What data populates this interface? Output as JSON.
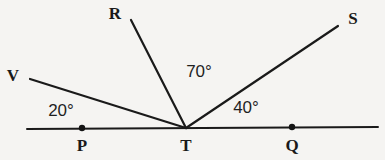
{
  "figure": {
    "type": "geometry-diagram",
    "background_color": "#f5f4f2",
    "stroke_color": "#1a1a1a",
    "width": 385,
    "height": 160
  },
  "points": [
    {
      "name": "P",
      "label": "P",
      "x": 82,
      "y": 128,
      "label_x": 82,
      "label_y": 145,
      "dot": true
    },
    {
      "name": "T",
      "label": "T",
      "x": 186,
      "y": 128,
      "label_x": 186,
      "label_y": 145,
      "dot": false
    },
    {
      "name": "Q",
      "label": "Q",
      "x": 292,
      "y": 127,
      "label_x": 292,
      "label_y": 145,
      "dot": true
    },
    {
      "name": "V",
      "label": "V",
      "x": 30,
      "y": 79,
      "label_x": 13,
      "label_y": 75,
      "dot": false
    },
    {
      "name": "R",
      "label": "R",
      "x": 131,
      "y": 20,
      "label_x": 115,
      "label_y": 13,
      "dot": false
    },
    {
      "name": "S",
      "label": "S",
      "x": 338,
      "y": 26,
      "label_x": 353,
      "label_y": 18,
      "dot": false
    }
  ],
  "base_line": {
    "name": "line-PQ",
    "x1": 27,
    "y1": 129,
    "x2": 378,
    "y2": 127
  },
  "rays": [
    {
      "name": "ray-TV",
      "x1": 186,
      "y1": 128,
      "x2": 30,
      "y2": 79
    },
    {
      "name": "ray-TR",
      "x1": 186,
      "y1": 128,
      "x2": 131,
      "y2": 20
    },
    {
      "name": "ray-TS",
      "x1": 186,
      "y1": 128,
      "x2": 338,
      "y2": 26
    }
  ],
  "angle_labels": [
    {
      "name": "angle-VTP",
      "text": "20°",
      "x": 61,
      "y": 110,
      "between": [
        "V",
        "P"
      ]
    },
    {
      "name": "angle-RTS",
      "text": "70°",
      "x": 199,
      "y": 71,
      "between": [
        "R",
        "S"
      ]
    },
    {
      "name": "angle-STQ",
      "text": "40°",
      "x": 246,
      "y": 107,
      "between": [
        "S",
        "Q"
      ]
    }
  ]
}
